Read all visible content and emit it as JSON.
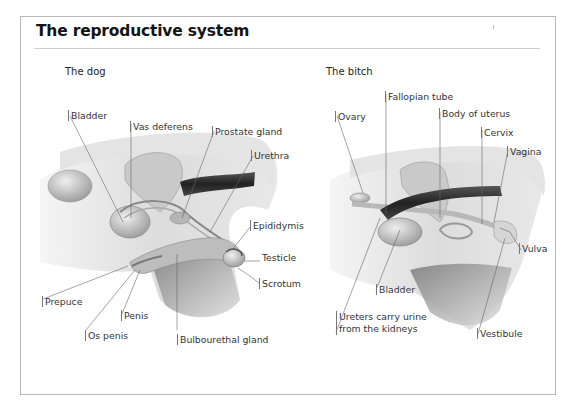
{
  "title": "The reproductive system",
  "panels": {
    "dog": {
      "heading": "The dog",
      "labels": {
        "bladder": "Bladder",
        "vas_deferens": "Vas deferens",
        "prostate_gland": "Prostate gland",
        "urethra": "Urethra",
        "epididymis": "Epididymis",
        "testicle": "Testicle",
        "scrotum": "Scrotum",
        "prepuce": "Prepuce",
        "penis": "Penis",
        "os_penis": "Os penis",
        "bulbourethal_gland": "Bulbourethal gland"
      }
    },
    "bitch": {
      "heading": "The bitch",
      "labels": {
        "ovary": "Ovary",
        "fallopian_tube": "Fallopian tube",
        "body_of_uterus": "Body of uterus",
        "cervix": "Cervix",
        "vagina": "Vagina",
        "vulva": "Vulva",
        "bladder": "Bladder",
        "ureters_line1": "Ureters carry urine",
        "ureters_line2": "from the kidneys",
        "vestibule": "Vestibule"
      }
    }
  },
  "colors": {
    "frame_border": "#b9b9b9",
    "title": "#141414",
    "leader_line": "#666666",
    "dark_tube": "#2b2b2b"
  }
}
